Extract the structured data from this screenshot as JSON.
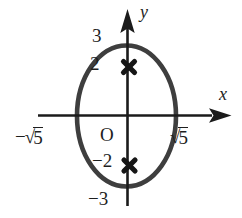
{
  "figure": {
    "background_color": "#ffffff",
    "axis_color": "#1b1b1b",
    "ellipse_color": "#3e3e3e",
    "marker_color": "#161616",
    "labels": {
      "y_axis": "y",
      "x_axis": "x",
      "origin": "O",
      "y_positive_vertex": "3",
      "upper_focus": "2",
      "lower_focus": "−2",
      "y_negative_vertex": "−3",
      "x_negative_prefix": "−√",
      "x_negative_radicand": "5",
      "x_positive_prefix": "√",
      "x_positive_radicand": "5"
    },
    "marked_points": {
      "y_intercepts": [
        "3",
        "−3"
      ],
      "x_intercepts": [
        "−√5",
        "√5"
      ],
      "foci_y_values": [
        "2",
        "−2"
      ]
    }
  }
}
